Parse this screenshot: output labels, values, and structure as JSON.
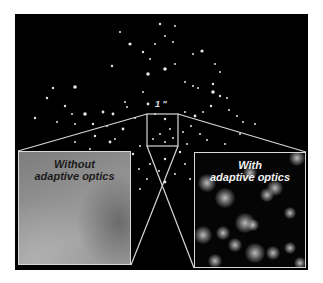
{
  "figure": {
    "background_color": "#000000",
    "line_color": "#d8d8d8",
    "scale_label": "1 \""
  },
  "insets": {
    "left": {
      "label_line1": "Without",
      "label_line2": "adaptive optics"
    },
    "right": {
      "label_line1": "With",
      "label_line2": "adaptive optics"
    }
  },
  "zoom_box": {
    "x": 132,
    "y": 100,
    "width": 31,
    "height": 32
  },
  "stars": [
    [
      145,
      10,
      1.2
    ],
    [
      160,
      12,
      1.0
    ],
    [
      105,
      18,
      1.0
    ],
    [
      150,
      22,
      1.0
    ],
    [
      115,
      30,
      1.6
    ],
    [
      140,
      30,
      1.0
    ],
    [
      158,
      28,
      1.0
    ],
    [
      128,
      38,
      1.2
    ],
    [
      135,
      45,
      1.0
    ],
    [
      178,
      40,
      1.0
    ],
    [
      187,
      37,
      1.6
    ],
    [
      160,
      50,
      1.0
    ],
    [
      150,
      55,
      1.8
    ],
    [
      133,
      60,
      1.8
    ],
    [
      97,
      52,
      1.2
    ],
    [
      200,
      50,
      1.0
    ],
    [
      205,
      58,
      1.0
    ],
    [
      198,
      70,
      1.2
    ],
    [
      183,
      74,
      1.0
    ],
    [
      198,
      78,
      1.8
    ],
    [
      205,
      82,
      1.2
    ],
    [
      212,
      84,
      1.0
    ],
    [
      170,
      68,
      1.0
    ],
    [
      178,
      72,
      1.0
    ],
    [
      60,
      73,
      1.8
    ],
    [
      38,
      74,
      1.2
    ],
    [
      32,
      84,
      1.2
    ],
    [
      50,
      92,
      1.2
    ],
    [
      57,
      100,
      1.0
    ],
    [
      70,
      100,
      1.8
    ],
    [
      88,
      98,
      1.4
    ],
    [
      110,
      88,
      1.0
    ],
    [
      128,
      78,
      1.0
    ],
    [
      133,
      90,
      1.4
    ],
    [
      112,
      93,
      1.0
    ],
    [
      98,
      100,
      1.4
    ],
    [
      20,
      104,
      1.2
    ],
    [
      42,
      108,
      1.0
    ],
    [
      60,
      110,
      1.0
    ],
    [
      78,
      110,
      1.2
    ],
    [
      92,
      112,
      1.0
    ],
    [
      108,
      115,
      1.4
    ],
    [
      120,
      104,
      1.0
    ],
    [
      140,
      100,
      1.0
    ],
    [
      150,
      105,
      1.2
    ],
    [
      155,
      115,
      1.0
    ],
    [
      145,
      120,
      1.0
    ],
    [
      138,
      125,
      1.0
    ],
    [
      150,
      128,
      1.0
    ],
    [
      158,
      124,
      1.0
    ],
    [
      170,
      98,
      1.0
    ],
    [
      180,
      102,
      1.4
    ],
    [
      188,
      98,
      1.0
    ],
    [
      196,
      92,
      1.2
    ],
    [
      214,
      96,
      1.0
    ],
    [
      222,
      102,
      1.0
    ],
    [
      228,
      108,
      1.0
    ],
    [
      176,
      112,
      1.0
    ],
    [
      185,
      120,
      1.0
    ],
    [
      192,
      126,
      1.0
    ],
    [
      168,
      118,
      1.0
    ],
    [
      172,
      130,
      1.0
    ],
    [
      125,
      132,
      1.0
    ],
    [
      118,
      140,
      1.2
    ],
    [
      124,
      155,
      1.0
    ],
    [
      135,
      150,
      1.0
    ],
    [
      150,
      145,
      1.2
    ],
    [
      165,
      138,
      1.2
    ],
    [
      170,
      150,
      1.0
    ],
    [
      144,
      157,
      1.0
    ],
    [
      132,
      165,
      1.0
    ],
    [
      160,
      160,
      1.0
    ],
    [
      150,
      168,
      1.4
    ],
    [
      125,
      175,
      1.0
    ],
    [
      175,
      165,
      1.0
    ],
    [
      60,
      128,
      1.0
    ],
    [
      80,
      122,
      1.2
    ],
    [
      95,
      128,
      1.4
    ],
    [
      100,
      125,
      1.0
    ],
    [
      75,
      135,
      1.0
    ],
    [
      210,
      130,
      1.0
    ],
    [
      225,
      120,
      1.0
    ],
    [
      240,
      110,
      1.0
    ],
    [
      190,
      140,
      1.0
    ]
  ],
  "blobs": [
    [
      12,
      30,
      11
    ],
    [
      30,
      45,
      12
    ],
    [
      55,
      20,
      9
    ],
    [
      72,
      42,
      9
    ],
    [
      80,
      35,
      10
    ],
    [
      102,
      5,
      10
    ],
    [
      8,
      82,
      11
    ],
    [
      28,
      80,
      9
    ],
    [
      50,
      70,
      12
    ],
    [
      58,
      72,
      8
    ],
    [
      40,
      92,
      9
    ],
    [
      60,
      100,
      12
    ],
    [
      78,
      100,
      9
    ],
    [
      95,
      95,
      8
    ],
    [
      95,
      60,
      7
    ],
    [
      20,
      108,
      9
    ],
    [
      105,
      110,
      8
    ]
  ]
}
